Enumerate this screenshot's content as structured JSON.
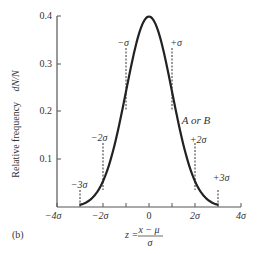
{
  "figure_label": "(b)",
  "chart_data": {
    "type": "line",
    "title": "",
    "xlabel": "z = (x − μ) / σ",
    "xlabel_parts": {
      "lhs": "z =",
      "numerator": "x − μ",
      "denominator": "σ"
    },
    "ylabel": "Relative frequency  dN/N",
    "ylabel_parts": {
      "text": "Relative frequency",
      "symbol": "dN/N"
    },
    "xlim": [
      -4,
      4
    ],
    "ylim": [
      0,
      0.4
    ],
    "x_ticks": [
      -4,
      -3,
      -2,
      -1,
      0,
      1,
      2,
      3,
      4
    ],
    "x_tick_labels": [
      {
        "value": -4,
        "label": "−4σ"
      },
      {
        "value": -2,
        "label": "−2σ"
      },
      {
        "value": 0,
        "label": "0"
      },
      {
        "value": 2,
        "label": "2σ"
      },
      {
        "value": 4,
        "label": "4σ"
      }
    ],
    "y_ticks": [
      0.1,
      0.2,
      0.3,
      0.4
    ],
    "y_tick_labels": [
      "0.1",
      "0.2",
      "0.3",
      "0.4"
    ],
    "grid": false,
    "series": [
      {
        "name": "A or B",
        "description": "Standard normal (Gaussian) density curve, drawn from z = −3 to z = +3",
        "x": [
          -3.0,
          -2.5,
          -2.0,
          -1.5,
          -1.0,
          -0.5,
          0.0,
          0.5,
          1.0,
          1.5,
          2.0,
          2.5,
          3.0
        ],
        "values": [
          0.004,
          0.018,
          0.054,
          0.13,
          0.242,
          0.352,
          0.399,
          0.352,
          0.242,
          0.13,
          0.054,
          0.018,
          0.004
        ]
      }
    ],
    "annotations": [
      {
        "label": "−σ",
        "x": -1,
        "type": "dashed-marker"
      },
      {
        "label": "+σ",
        "x": 1,
        "type": "dashed-marker"
      },
      {
        "label": "−2σ",
        "x": -2,
        "type": "dashed-marker"
      },
      {
        "label": "+2σ",
        "x": 2,
        "type": "dashed-marker"
      },
      {
        "label": "−3σ",
        "x": -3,
        "type": "dashed-marker"
      },
      {
        "label": "+3σ",
        "x": 3,
        "type": "dashed-marker"
      },
      {
        "label": "A or B",
        "type": "curve-label"
      }
    ]
  }
}
